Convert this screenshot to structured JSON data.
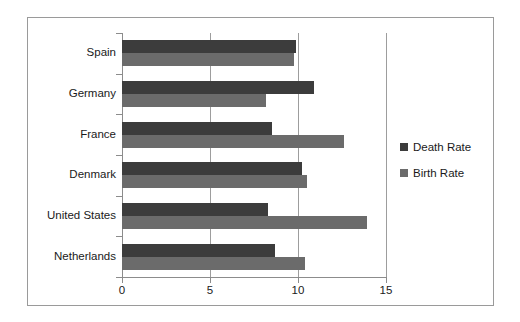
{
  "chart_data": {
    "type": "bar",
    "orientation": "horizontal",
    "title": "",
    "xlabel": "",
    "ylabel": "",
    "xlim": [
      0,
      15
    ],
    "xticks": [
      "0",
      "5",
      "10",
      "15"
    ],
    "grid": true,
    "legend_position": "right",
    "categories": [
      "Spain",
      "Germany",
      "France",
      "Denmark",
      "United States",
      "Netherlands"
    ],
    "series": [
      {
        "name": "Death Rate",
        "color": "#3c3c3c",
        "values": [
          9.9,
          10.9,
          8.5,
          10.2,
          8.3,
          8.7
        ]
      },
      {
        "name": "Birth Rate",
        "color": "#6b6b6b",
        "values": [
          9.8,
          8.2,
          12.6,
          10.5,
          13.9,
          10.4
        ]
      }
    ]
  },
  "legend": {
    "entries": [
      {
        "label": "Death Rate",
        "swatch": "death"
      },
      {
        "label": "Birth Rate",
        "swatch": "birth"
      }
    ]
  }
}
